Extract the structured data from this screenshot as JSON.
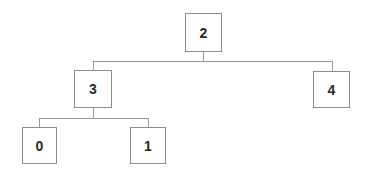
{
  "tree": {
    "root": "2",
    "nodes": [
      {
        "id": "2",
        "label": "2",
        "children": [
          "3",
          "4"
        ]
      },
      {
        "id": "3",
        "label": "3",
        "children": [
          "0",
          "1"
        ]
      },
      {
        "id": "4",
        "label": "4",
        "children": []
      },
      {
        "id": "0",
        "label": "0",
        "children": []
      },
      {
        "id": "1",
        "label": "1",
        "children": []
      }
    ]
  },
  "colors": {
    "border": "#8c8c8c",
    "connector": "#9a9a9a",
    "text": "#2a2a2a",
    "background": "#ffffff"
  }
}
